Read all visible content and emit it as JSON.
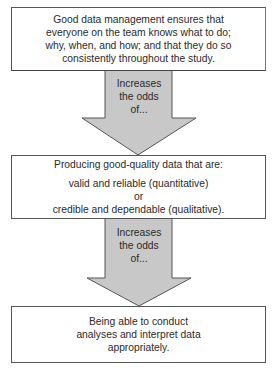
{
  "diagram": {
    "type": "vertical-flow",
    "colors": {
      "box_fill": "#ffffff",
      "box_border": "#555555",
      "arrow_fill": "#c8c8c8",
      "arrow_border": "#555555",
      "text": "#2a2a2a"
    },
    "boxes": [
      {
        "lines": [
          "Good data management ensures that",
          "everyone on the team knows what to do;",
          "why, when, and how; and that they do so",
          "consistently throughout the study."
        ]
      },
      {
        "heading": "Producing good-quality data that are:",
        "lines": [
          "valid and reliable (quantitative)",
          "or",
          "credible and dependable (qualitative)."
        ]
      },
      {
        "lines": [
          "Being able to conduct",
          "analyses and interpret data",
          "appropriately."
        ]
      }
    ],
    "arrows": [
      {
        "label_lines": [
          "Increases",
          "the odds",
          "of..."
        ]
      },
      {
        "label_lines": [
          "Increases",
          "the odds",
          "of..."
        ]
      }
    ]
  }
}
